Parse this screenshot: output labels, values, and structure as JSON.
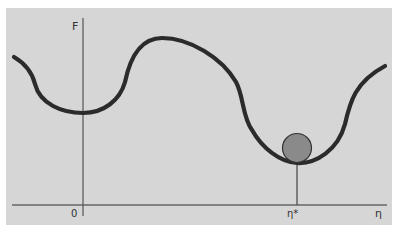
{
  "diagram": {
    "y_axis_label": "F",
    "x_axis_label": "η",
    "x_origin_label": "0",
    "x_marker_label": "η*",
    "ball": {
      "description": "ball resting in global minimum",
      "color": "#8a8a8a"
    },
    "colors": {
      "background": "#d6d6d6",
      "curve": "#2b2b2b",
      "axes": "#555555"
    }
  }
}
